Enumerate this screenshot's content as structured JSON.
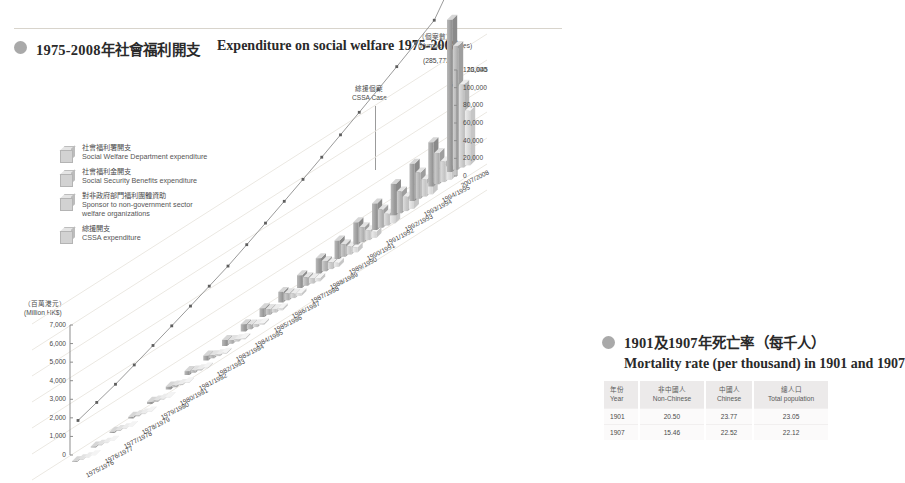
{
  "section1": {
    "bullet_icon": "filled-circle-icon",
    "title_cn": "1975-2008年社會福利開支",
    "title_en": "Expenditure on social welfare 1975-2008",
    "legend": [
      {
        "icon": "cube-swatch-icon",
        "cn": "社會福利署開支",
        "en": "Social Welfare Department expenditure"
      },
      {
        "icon": "cube-swatch-icon",
        "cn": "社會福利金開支",
        "en": "Social Security Benefits expenditure"
      },
      {
        "icon": "cube-swatch-icon",
        "cn": "對非政府部門福利團體資助",
        "en": "Sponsor to non-government sector welfare organizations"
      },
      {
        "icon": "cube-swatch-icon",
        "cn": "綜援開支",
        "en": "CSSA expenditure"
      }
    ],
    "left_axis_cn": "（百萬港元）",
    "left_axis_en": "(Million HK$)",
    "right_axis_cn": "（個案數）",
    "right_axis_en": "(Number of cases)",
    "annotation_cn": "綜援個案",
    "annotation_en": "CSSA Case",
    "callout_285773": "(285,773)",
    "callout_18045": "18,045",
    "callout_6908": "6,908"
  },
  "section2": {
    "bullet_icon": "filled-circle-icon",
    "title_cn": "1901及1907年死亡率（每千人）",
    "title_en": "Mortality  rate (per thousand) in 1901 and 1907",
    "table": {
      "headers": [
        {
          "cn": "年份",
          "en": "Year"
        },
        {
          "cn": "非中國人",
          "en": "Non-Chinese"
        },
        {
          "cn": "中國人",
          "en": "Chinese"
        },
        {
          "cn": "總人口",
          "en": "Total population"
        }
      ],
      "rows": [
        [
          "1901",
          "20.50",
          "23.77",
          "23.05"
        ],
        [
          "1907",
          "15.46",
          "22.52",
          "22.12"
        ]
      ]
    }
  },
  "chart_data": {
    "type": "bar",
    "title": "Expenditure on social welfare 1975-2008",
    "xlabel": "",
    "ylabel": "(Million HK$)",
    "y2label": "(Number of cases)",
    "ylim": [
      0,
      7000
    ],
    "y2lim": [
      0,
      120000
    ],
    "yticks": [
      "0",
      "1,000",
      "2,000",
      "3,000",
      "4,000",
      "5,000",
      "6,000",
      "7,000"
    ],
    "y2ticks": [
      "0",
      "20,000",
      "40,000",
      "60,000",
      "80,000",
      "100,000",
      "120,000"
    ],
    "grid": false,
    "legend_position": "upper-left",
    "categories": [
      "1975/1976",
      "1976/1977",
      "1977/1978",
      "1978/1979",
      "1979/1980",
      "1980/1981",
      "1981/1982",
      "1982/1983",
      "1983/1984",
      "1984/1985",
      "1985/1986",
      "1986/1987",
      "1987/1988",
      "1988/1989",
      "1989/1990",
      "1990/1991",
      "1991/1992",
      "1992/1993",
      "1993/1994",
      "1994/1995",
      "2007/2008"
    ],
    "series": [
      {
        "name": "Social Welfare Department expenditure",
        "values": [
          120,
          150,
          190,
          240,
          310,
          400,
          520,
          640,
          760,
          900,
          1050,
          1240,
          1450,
          1700,
          2000,
          2350,
          2750,
          3200,
          3700,
          4300,
          14500
        ]
      },
      {
        "name": "Social Security Benefits expenditure",
        "values": [
          70,
          90,
          115,
          150,
          190,
          250,
          320,
          400,
          480,
          580,
          690,
          820,
          970,
          1150,
          1360,
          1600,
          1890,
          2220,
          2600,
          3050,
          11800
        ]
      },
      {
        "name": "Sponsor to non-government sector welfare organizations",
        "values": [
          40,
          55,
          70,
          90,
          115,
          150,
          195,
          245,
          300,
          365,
          440,
          530,
          630,
          750,
          890,
          1050,
          1240,
          1460,
          1710,
          2010,
          7900
        ]
      },
      {
        "name": "CSSA expenditure",
        "values": [
          20,
          28,
          38,
          50,
          65,
          85,
          110,
          140,
          175,
          215,
          265,
          320,
          385,
          460,
          550,
          655,
          780,
          925,
          1095,
          1295,
          5200
        ]
      }
    ],
    "line_series": {
      "name": "CSSA Case",
      "unit": "cases",
      "values": [
        28000,
        31000,
        34000,
        38000,
        42000,
        46000,
        50000,
        54000,
        58000,
        63000,
        68000,
        73000,
        78000,
        83000,
        88000,
        93000,
        98000,
        103000,
        108000,
        113000,
        285773
      ]
    },
    "annotations": [
      {
        "label": "(285,773)",
        "series": "CSSA Case"
      },
      {
        "label": "18,045"
      },
      {
        "label": "6,908"
      }
    ]
  }
}
